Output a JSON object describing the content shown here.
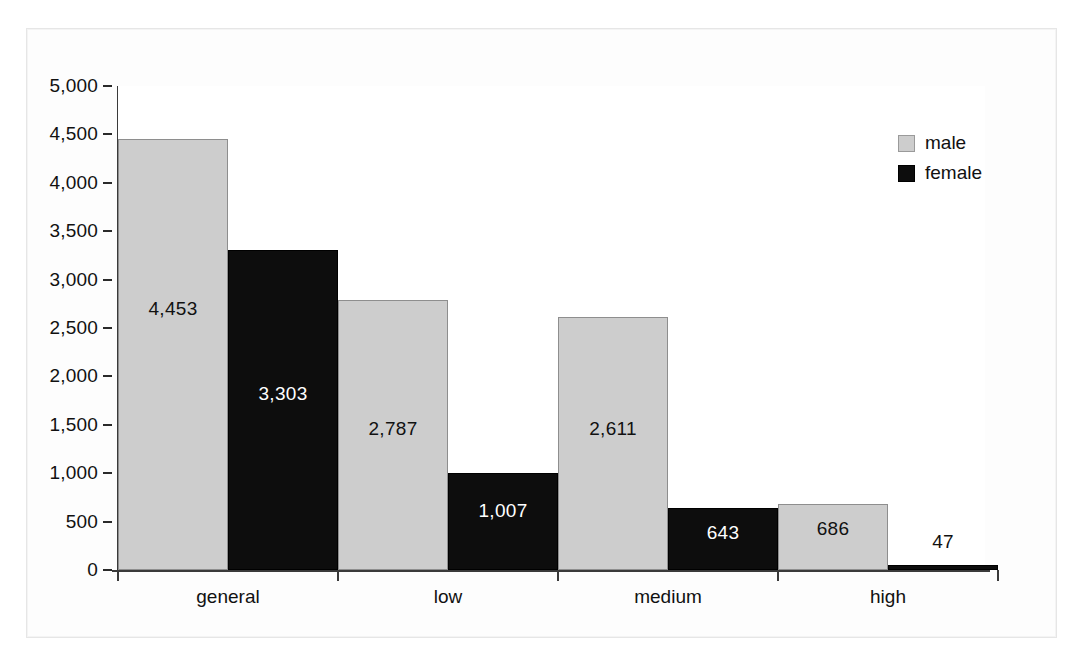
{
  "chart_data": {
    "type": "bar",
    "title": "",
    "subtitle": "",
    "xlabel": "",
    "ylabel": "",
    "categories": [
      "general",
      "low",
      "medium",
      "high"
    ],
    "series": [
      {
        "name": "male",
        "color": "#cdcdcd",
        "values": [
          4453,
          2787,
          2611,
          686
        ]
      },
      {
        "name": "female",
        "color": "#0d0d0d",
        "values": [
          3303,
          1007,
          643,
          47
        ]
      }
    ],
    "data_labels": [
      {
        "series": "male",
        "category": "general",
        "text": "4,453"
      },
      {
        "series": "female",
        "category": "general",
        "text": "3,303"
      },
      {
        "series": "male",
        "category": "low",
        "text": "2,787"
      },
      {
        "series": "female",
        "category": "low",
        "text": "1,007"
      },
      {
        "series": "male",
        "category": "medium",
        "text": "2,611"
      },
      {
        "series": "female",
        "category": "medium",
        "text": "643"
      },
      {
        "series": "male",
        "category": "high",
        "text": "686"
      },
      {
        "series": "female",
        "category": "high",
        "text": "47"
      }
    ],
    "ylim": [
      0,
      5000
    ],
    "ytick_step": 500,
    "ytick_labels": [
      "5,000",
      "4,500",
      "4,000",
      "3,500",
      "3,000",
      "2,500",
      "2,000",
      "1,500",
      "1,000",
      "500",
      "0"
    ],
    "ytick_values": [
      5000,
      4500,
      4000,
      3500,
      3000,
      2500,
      2000,
      1500,
      1000,
      500,
      0
    ],
    "grid": false,
    "legend": {
      "position": "top-right",
      "entries": [
        {
          "label": "male",
          "color": "#cdcdcd"
        },
        {
          "label": "female",
          "color": "#0d0d0d"
        }
      ]
    },
    "bar_gap_within_group": 0,
    "bar_gap_between_groups": 0
  }
}
